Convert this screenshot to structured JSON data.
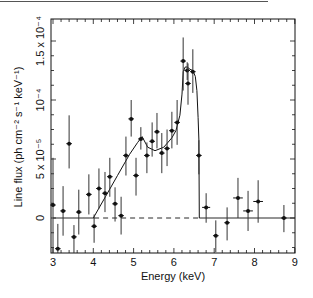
{
  "chart_data": {
    "type": "scatter",
    "title": "",
    "xlabel": "Energy (keV)",
    "ylabel": "Line flux (ph cm⁻² s⁻¹ keV⁻¹)",
    "xlim": [
      3,
      9
    ],
    "ylim": [
      -3e-05,
      0.00015
    ],
    "grid": false,
    "legend": "none",
    "x_ticks": [
      3,
      4,
      5,
      6,
      7,
      8,
      9
    ],
    "x_tick_labels": [
      "3",
      "4",
      "5",
      "6",
      "7",
      "8",
      "9"
    ],
    "y_ticks": [
      0,
      5e-05,
      0.0001,
      0.00015
    ],
    "y_tick_labels": [
      "0",
      "5 x 10⁻⁵",
      "10⁻⁴",
      "1.5 x 10⁻⁴"
    ],
    "y_unit_scale": 1e-05,
    "series": [
      {
        "name": "data",
        "style": "points-with-errorbars",
        "points": [
          {
            "x": 3.0,
            "y": 1.1,
            "ylo": -3.1,
            "yhi": 5.1
          },
          {
            "x": 3.12,
            "y": -2.6,
            "ylo": -3.0,
            "yhi": -0.5
          },
          {
            "x": 3.25,
            "y": 0.6,
            "ylo": -1.5,
            "yhi": 2.7
          },
          {
            "x": 3.4,
            "y": 6.3,
            "ylo": 4.2,
            "yhi": 8.7
          },
          {
            "x": 3.52,
            "y": -1.6,
            "ylo": -3.1,
            "yhi": -0.6
          },
          {
            "x": 3.64,
            "y": 0.5,
            "ylo": -1.4,
            "yhi": 2.4
          },
          {
            "x": 3.89,
            "y": 2.0,
            "ylo": 0.3,
            "yhi": 3.7
          },
          {
            "x": 4.02,
            "y": -0.7,
            "ylo": -2.1,
            "yhi": 0.3
          },
          {
            "x": 4.14,
            "y": 2.5,
            "ylo": 0.8,
            "yhi": 4.2
          },
          {
            "x": 4.29,
            "y": 2.1,
            "ylo": 0.5,
            "yhi": 3.9
          },
          {
            "x": 4.41,
            "y": 3.5,
            "ylo": 1.8,
            "yhi": 5.1
          },
          {
            "x": 4.54,
            "y": 1.2,
            "ylo": -0.3,
            "yhi": 2.6
          },
          {
            "x": 4.69,
            "y": 0.2,
            "ylo": -1.4,
            "yhi": 1.8
          },
          {
            "x": 4.81,
            "y": 5.3,
            "ylo": 3.6,
            "yhi": 6.9
          },
          {
            "x": 4.94,
            "y": 8.4,
            "ylo": 6.9,
            "yhi": 10.0
          },
          {
            "x": 5.06,
            "y": 3.6,
            "ylo": 1.9,
            "yhi": 5.1
          },
          {
            "x": 5.18,
            "y": 6.7,
            "ylo": 5.8,
            "yhi": 7.7
          },
          {
            "x": 5.33,
            "y": 5.3,
            "ylo": 3.8,
            "yhi": 6.4
          },
          {
            "x": 5.46,
            "y": 6.5,
            "ylo": 5.2,
            "yhi": 8.1
          },
          {
            "x": 5.58,
            "y": 7.3,
            "ylo": 5.9,
            "yhi": 8.9
          },
          {
            "x": 5.7,
            "y": 5.5,
            "ylo": 3.8,
            "yhi": 7.2
          },
          {
            "x": 5.83,
            "y": 5.9,
            "ylo": 4.4,
            "yhi": 7.5
          },
          {
            "x": 5.95,
            "y": 7.4,
            "ylo": 5.9,
            "yhi": 9.0
          },
          {
            "x": 6.08,
            "y": 8.1,
            "ylo": 6.2,
            "yhi": 10.0
          },
          {
            "x": 6.23,
            "y": 13.3,
            "ylo": 10.8,
            "yhi": 15.3
          },
          {
            "x": 6.33,
            "y": 12.5,
            "ylo": 11.7,
            "yhi": 13.2
          },
          {
            "x": 6.35,
            "y": 11.4,
            "ylo": 9.6,
            "yhi": 13.1
          },
          {
            "x": 6.47,
            "y": 12.4,
            "ylo": 10.6,
            "yhi": 14.3
          },
          {
            "x": 6.62,
            "y": 5.3,
            "ylo": 3.7,
            "yhi": 6.6
          },
          {
            "x": 6.8,
            "y": 0.9,
            "ylo": -0.4,
            "yhi": 2.1,
            "xerr": 0.1
          },
          {
            "x": 7.04,
            "y": -1.5,
            "ylo": -2.9,
            "yhi": -0.2
          },
          {
            "x": 7.32,
            "y": -0.4,
            "ylo": -1.9,
            "yhi": 0.9
          },
          {
            "x": 7.59,
            "y": 1.7,
            "ylo": 0.0,
            "yhi": 3.4,
            "xerr": 0.12
          },
          {
            "x": 7.84,
            "y": 0.6,
            "ylo": -1.1,
            "yhi": 2.3,
            "xerr": 0.12
          },
          {
            "x": 8.09,
            "y": 1.4,
            "ylo": -0.4,
            "yhi": 3.2,
            "xerr": 0.12
          },
          {
            "x": 8.73,
            "y": 0.0,
            "ylo": -1.2,
            "yhi": 1.1
          }
        ]
      },
      {
        "name": "model",
        "style": "line",
        "x": [
          4.0,
          4.3,
          4.6,
          4.9,
          5.1,
          5.21,
          5.35,
          5.53,
          5.75,
          5.95,
          6.05,
          6.15,
          6.2,
          6.23,
          6.28,
          6.33,
          6.4,
          6.47,
          6.53,
          6.57,
          6.6,
          6.62,
          6.63
        ],
        "y": [
          0.0,
          1.8,
          3.6,
          5.4,
          6.4,
          6.9,
          6.0,
          5.7,
          6.0,
          6.8,
          7.4,
          8.7,
          10.5,
          12.4,
          12.8,
          12.8,
          12.6,
          12.5,
          12.0,
          10.8,
          8.5,
          6.6,
          0.0
        ]
      },
      {
        "name": "zero-baseline",
        "style": "hline",
        "y": 0,
        "segments": [
          {
            "from": 3.0,
            "to": 4.02,
            "dash": false
          },
          {
            "from": 4.02,
            "to": 6.63,
            "dash": true
          },
          {
            "from": 6.63,
            "to": 9.0,
            "dash": false
          }
        ]
      }
    ]
  }
}
